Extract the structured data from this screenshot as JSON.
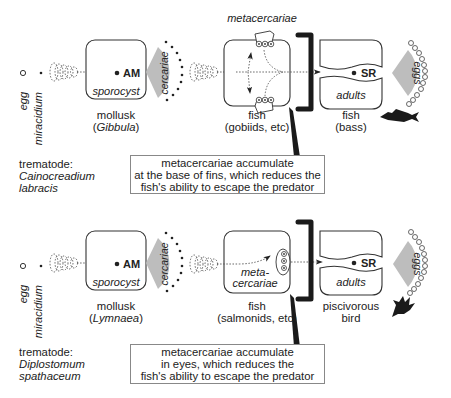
{
  "diagram": {
    "type": "life-cycle",
    "rows": [
      {
        "id": "cainocreadium",
        "stages": {
          "egg": "egg",
          "miracidium": "miracidium",
          "first_host_stage": "sporocyst",
          "first_host_label": "AM",
          "release": "cercariae",
          "second_host_stage": "metacercariae",
          "final_host_stage": "adults",
          "final_host_label": "SR",
          "output": "eggs"
        },
        "hosts": {
          "first": {
            "name": "mollusk",
            "genus": "Gibbula"
          },
          "second": {
            "name": "fish",
            "detail": "(gobiids, etc)"
          },
          "final": {
            "name": "fish",
            "detail": "(bass)",
            "icon": "fish-silhouette-icon"
          }
        },
        "trematode": {
          "label": "trematode:",
          "genus": "Cainocreadium",
          "species": "labracis"
        },
        "note": {
          "line1": "metacercariae accumulate",
          "line2": "at the base of fins, which reduces the",
          "line3": "fish's ability to escape the predator"
        }
      },
      {
        "id": "diplostomum",
        "stages": {
          "egg": "egg",
          "miracidium": "miracidium",
          "first_host_stage": "sporocyst",
          "first_host_label": "AM",
          "release": "cercariae",
          "second_host_stage_l1": "meta-",
          "second_host_stage_l2": "cercariae",
          "final_host_stage": "adults",
          "final_host_label": "SR",
          "output": "eggs"
        },
        "hosts": {
          "first": {
            "name": "mollusk",
            "genus": "Lymnaea"
          },
          "second": {
            "name": "fish",
            "detail": "(salmonids, etc)"
          },
          "final": {
            "name": "piscivorous",
            "detail": "bird",
            "icon": "bird-silhouette-icon"
          }
        },
        "trematode": {
          "label": "trematode:",
          "genus": "Diplostomum",
          "species": "spathaceum"
        },
        "note": {
          "line1": "metacercariae accumulate",
          "line2": "in eyes, which reduces the",
          "line3": "fish's ability to escape the predator"
        }
      }
    ],
    "colors": {
      "fan": "#bdbdbd",
      "ink": "#222222",
      "bracket": "#1a1a1a"
    }
  }
}
